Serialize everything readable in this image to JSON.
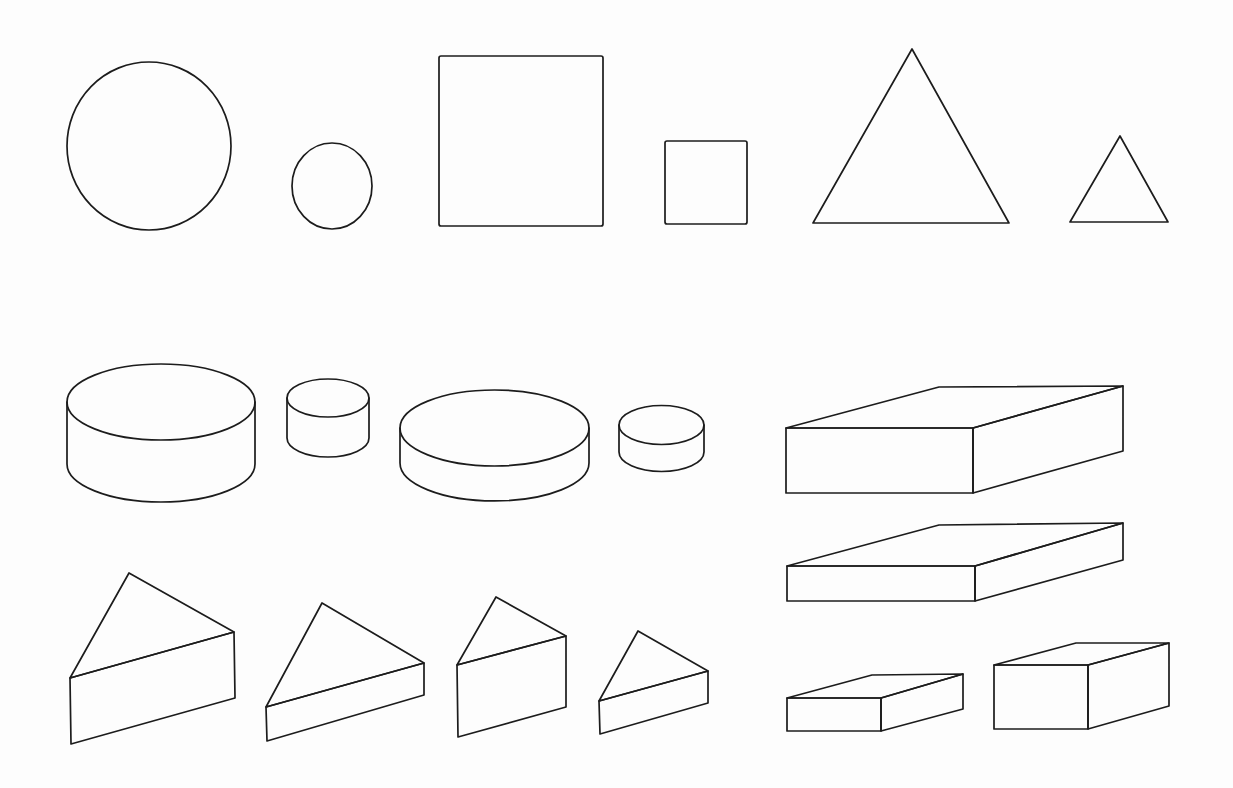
{
  "diagram": {
    "title": "",
    "background": "#fdfdfd",
    "line_color": "#1c1c1c",
    "flat_shapes": [
      {
        "type": "circle",
        "label": "large circle",
        "cx": 149,
        "cy": 146,
        "rx": 82,
        "ry": 84
      },
      {
        "type": "circle",
        "label": "small circle",
        "cx": 332,
        "cy": 186,
        "rx": 40,
        "ry": 43
      },
      {
        "type": "square",
        "label": "large square",
        "x": 439,
        "y": 56,
        "w": 164,
        "h": 170
      },
      {
        "type": "square",
        "label": "small square",
        "x": 665,
        "y": 141,
        "w": 82,
        "h": 83
      },
      {
        "type": "triangle",
        "label": "large triangle",
        "points": [
          [
            912,
            49
          ],
          [
            1009,
            223
          ],
          [
            813,
            223
          ]
        ]
      },
      {
        "type": "triangle",
        "label": "small triangle",
        "points": [
          [
            1120,
            136
          ],
          [
            1168,
            222
          ],
          [
            1070,
            222
          ]
        ]
      }
    ],
    "cylinders": [
      {
        "label": "large tall cylinder",
        "cx": 161,
        "rx": 94,
        "ry": 38,
        "top": 402,
        "bottom": 464
      },
      {
        "label": "small tall cylinder",
        "cx": 328,
        "rx": 41,
        "ry": 19,
        "top": 398,
        "bottom": 438
      },
      {
        "label": "large flat cylinder",
        "cx": 494.5,
        "rx": 94.5,
        "ry": 38,
        "top": 428,
        "bottom": 463
      },
      {
        "label": "small flat cylinder",
        "cx": 661.5,
        "rx": 42.5,
        "ry": 19.5,
        "top": 425,
        "bottom": 452
      }
    ],
    "boxes": [
      {
        "label": "large tall box",
        "front": [
          786,
          428,
          973,
          493
        ],
        "back_left": [
          939,
          387
        ],
        "back_right": [
          1123,
          386
        ],
        "right_bottom": [
          1123,
          451
        ]
      },
      {
        "label": "large flat box",
        "front": [
          787,
          566,
          975,
          601
        ],
        "back_left": [
          939,
          525
        ],
        "back_right": [
          1123,
          523
        ],
        "right_bottom": [
          1123,
          560
        ]
      },
      {
        "label": "small flat box",
        "front": [
          787,
          698,
          881,
          731
        ],
        "back_left": [
          872,
          675
        ],
        "back_right": [
          963,
          674
        ],
        "right_bottom": [
          963,
          709
        ]
      },
      {
        "label": "small tall box",
        "front": [
          994,
          665,
          1088,
          729
        ],
        "back_left": [
          1076,
          643
        ],
        "back_right": [
          1169,
          643
        ],
        "right_bottom": [
          1169,
          706
        ]
      }
    ],
    "prisms": [
      {
        "label": "large tall triangular prism",
        "apex": [
          129,
          573
        ],
        "left_top": [
          70,
          678
        ],
        "right_top": [
          234,
          632
        ],
        "right_bottom": [
          235,
          698
        ],
        "left_bottom": [
          71,
          744
        ]
      },
      {
        "label": "large flat triangular prism",
        "apex": [
          322,
          603
        ],
        "left_top": [
          266,
          707
        ],
        "right_top": [
          424,
          663
        ],
        "right_bottom": [
          424,
          695
        ],
        "left_bottom": [
          267,
          741
        ]
      },
      {
        "label": "small tall triangular prism",
        "apex": [
          496,
          597
        ],
        "left_top": [
          457,
          665
        ],
        "right_top": [
          566,
          636
        ],
        "right_bottom": [
          566,
          707
        ],
        "left_bottom": [
          458,
          737
        ]
      },
      {
        "label": "small flat triangular prism",
        "apex": [
          638,
          631
        ],
        "left_top": [
          599,
          701
        ],
        "right_top": [
          708,
          671
        ],
        "right_bottom": [
          708,
          703
        ],
        "left_bottom": [
          600,
          734
        ]
      }
    ]
  }
}
